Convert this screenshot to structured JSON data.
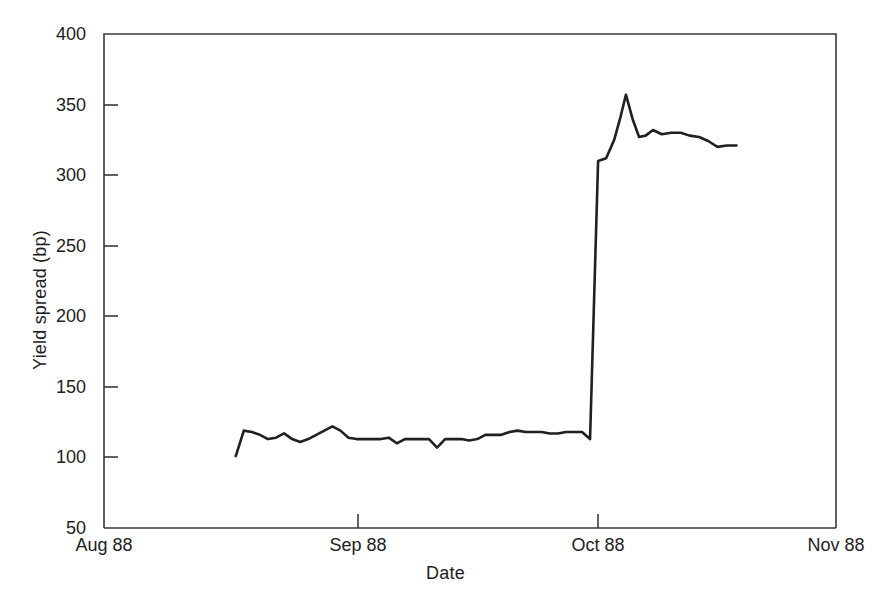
{
  "chart_data": {
    "type": "line",
    "title": "",
    "xlabel": "Date",
    "ylabel": "Yield spread (bp)",
    "ylim": [
      50,
      400
    ],
    "yticks": [
      50,
      100,
      150,
      200,
      250,
      300,
      350,
      400
    ],
    "ytick_labels": [
      "50",
      "100",
      "150",
      "200",
      "250",
      "300",
      "350",
      "400"
    ],
    "xlim_labels": [
      "Aug 88",
      "Sep 88",
      "Oct 88",
      "Nov 88"
    ],
    "xticks": [
      "Aug 88",
      "Sep 88",
      "Oct 88",
      "Nov 88"
    ],
    "xtick_positions_frac": [
      0.0,
      0.347,
      0.675,
      1.0
    ],
    "grid": false,
    "legend": false,
    "series": [
      {
        "name": "Yield spread",
        "color": "#211f1f",
        "x_frac": [
          0.18,
          0.191,
          0.202,
          0.213,
          0.224,
          0.235,
          0.246,
          0.257,
          0.268,
          0.279,
          0.29,
          0.301,
          0.312,
          0.323,
          0.334,
          0.345,
          0.356,
          0.367,
          0.378,
          0.389,
          0.4,
          0.411,
          0.422,
          0.433,
          0.444,
          0.455,
          0.466,
          0.477,
          0.488,
          0.499,
          0.51,
          0.521,
          0.532,
          0.543,
          0.554,
          0.565,
          0.576,
          0.587,
          0.598,
          0.609,
          0.62,
          0.631,
          0.642,
          0.653,
          0.664,
          0.675,
          0.686,
          0.697,
          0.705,
          0.713,
          0.722,
          0.731,
          0.74,
          0.75,
          0.762,
          0.775,
          0.788,
          0.8,
          0.813,
          0.826,
          0.838,
          0.851,
          0.864
        ],
        "values": [
          101,
          119,
          118,
          116,
          113,
          114,
          117,
          113,
          111,
          113,
          116,
          119,
          122,
          119,
          114,
          113,
          113,
          113,
          113,
          114,
          110,
          113,
          113,
          113,
          113,
          107,
          113,
          113,
          113,
          112,
          113,
          116,
          116,
          116,
          118,
          119,
          118,
          118,
          118,
          117,
          117,
          118,
          118,
          118,
          113,
          310,
          312,
          325,
          340,
          357,
          340,
          327,
          328,
          332,
          329,
          330,
          330,
          328,
          327,
          324,
          320,
          321,
          321
        ]
      }
    ],
    "annotations": []
  },
  "axis": {
    "ylabel": "Yield spread (bp)",
    "xlabel": "Date",
    "ytick_labels": [
      "400",
      "350",
      "300",
      "250",
      "200",
      "150",
      "100",
      "50"
    ],
    "xtick_labels": [
      "Aug 88",
      "Sep 88",
      "Oct 88",
      "Nov 88"
    ]
  }
}
